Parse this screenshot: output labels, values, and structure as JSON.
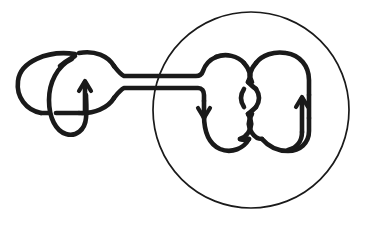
{
  "figure": {
    "title": "Knot diagram with satellite companion and clasp tangle inside a ball",
    "background_color": "#ffffff",
    "ink_color": "#1a1a1a",
    "width": 366,
    "height": 226,
    "ball": {
      "label": "bounding-ball",
      "center_x": 251,
      "center_y": 110,
      "radius": 98,
      "stroke_width": 1.7,
      "stroke_color": "#1a1a1a"
    },
    "strand_stroke_width": 4.6,
    "components": [
      {
        "name": "companion-knot",
        "label": "left trefoil-like companion knot",
        "crossings": 3
      },
      {
        "name": "connecting-band",
        "label": "two parallel connecting strands",
        "strand_count": 2
      },
      {
        "name": "clasp-tangle",
        "label": "clasp tangle inside ball",
        "crossings": 4
      }
    ],
    "orientation_arrows": [
      {
        "name": "arrow-companion",
        "direction": "up",
        "x": 85,
        "y": 95
      },
      {
        "name": "arrow-inner-left",
        "direction": "down",
        "x": 204,
        "y": 105
      },
      {
        "name": "arrow-inner-right",
        "direction": "up",
        "x": 302,
        "y": 112
      }
    ]
  },
  "chart_data": {
    "type": "diagram",
    "title": "Knot diagram with satellite companion and clasp tangle inside a ball",
    "elements": [
      "companion-knot",
      "connecting-band",
      "clasp-tangle",
      "bounding-ball",
      "arrow-companion",
      "arrow-inner-left",
      "arrow-inner-right"
    ]
  }
}
